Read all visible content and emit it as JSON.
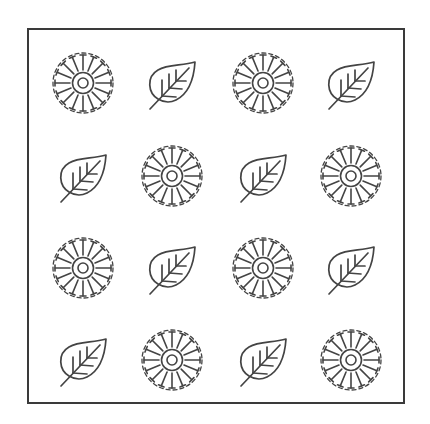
{
  "grid": {
    "rows": 4,
    "cols": 4,
    "stroke_color": "#444444",
    "frame_color": "#3a3a3a",
    "centers_x": [
      83,
      172,
      263,
      351
    ],
    "centers_y": [
      83,
      176,
      268,
      360
    ],
    "cells": [
      [
        "sun-icon",
        "leaf-icon",
        "sun-icon",
        "leaf-icon"
      ],
      [
        "leaf-icon",
        "sun-icon",
        "leaf-icon",
        "sun-icon"
      ],
      [
        "sun-icon",
        "leaf-icon",
        "sun-icon",
        "leaf-icon"
      ],
      [
        "leaf-icon",
        "sun-icon",
        "leaf-icon",
        "sun-icon"
      ]
    ]
  }
}
